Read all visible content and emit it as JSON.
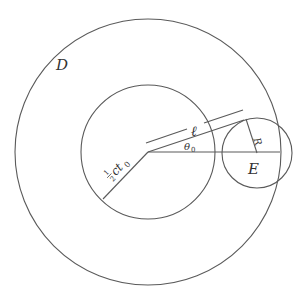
{
  "diagram": {
    "labels": {
      "outer_region": "D",
      "small_circle": "E",
      "radius": "R",
      "length": "ℓ",
      "angle": "θ",
      "angle_sub": "0",
      "inner_radius_num": "1",
      "inner_radius_den": "2",
      "inner_radius_rest": "ct",
      "inner_radius_sub": "0"
    },
    "colors": {
      "line": "#5a5a5a",
      "text": "#333333",
      "background": "#ffffff"
    }
  }
}
